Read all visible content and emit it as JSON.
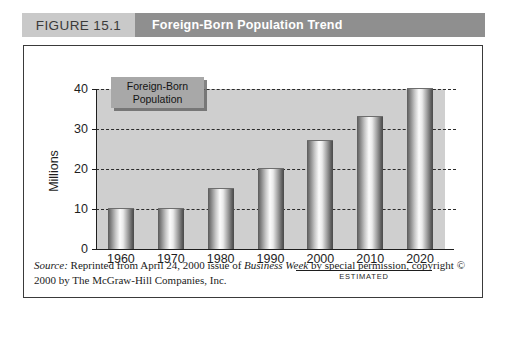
{
  "header": {
    "figure_number": "FIGURE 15.1",
    "figure_title": "Foreign-Born Population Trend",
    "number_box_color": "#c9c9c9",
    "title_box_color": "#8f8f8f"
  },
  "legend": {
    "line1": "Foreign-Born",
    "line2": "Population",
    "box_color": "#a8a8a8"
  },
  "axis": {
    "y_title": "Millions",
    "y_ticks": [
      "0",
      "10",
      "20",
      "30",
      "40"
    ],
    "estimated_label": "ESTIMATED"
  },
  "source": {
    "label": "Source:",
    "text_part1": " Reprinted from April 24, 2000 issue of ",
    "publication": "Business Week",
    "text_part2": " by special permission, copyright © 2000 by The McGraw-Hill Companies, Inc."
  },
  "chart_data": {
    "type": "bar",
    "title": "Foreign-Born Population Trend",
    "categories": [
      "1960",
      "1970",
      "1980",
      "1990",
      "2000",
      "2010",
      "2020"
    ],
    "values": [
      10,
      10,
      15,
      20,
      27,
      33,
      40
    ],
    "series": [
      {
        "name": "Foreign-Born Population",
        "values": [
          10,
          10,
          15,
          20,
          27,
          33,
          40
        ]
      }
    ],
    "xlabel": "",
    "ylabel": "Millions",
    "ylim": [
      0,
      40
    ],
    "yticks": [
      0,
      10,
      20,
      30,
      40
    ],
    "grid": true,
    "grid_style": "dashed-horizontal",
    "legend": "Foreign-Born Population",
    "legend_position": "top-left-inside",
    "annotations": [
      {
        "text": "ESTIMATED",
        "applies_to": [
          "2000",
          "2010",
          "2020"
        ]
      }
    ],
    "source": "Reprinted from April 24, 2000 issue of Business Week by special permission, copyright © 2000 by The McGraw-Hill Companies, Inc."
  }
}
